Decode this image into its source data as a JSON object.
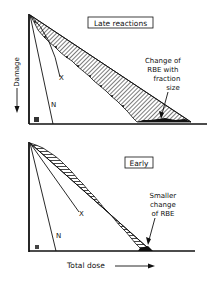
{
  "top_panel": {
    "title": "Late reactions",
    "y_axis_label": "Damage",
    "curve_labels": {
      "x": "X",
      "n": "N"
    },
    "annotation": [
      "Change of",
      "RBE with",
      "fraction",
      "size"
    ]
  },
  "bottom_panel": {
    "title": "Early",
    "curve_labels": {
      "x": "X",
      "n": "N"
    },
    "annotation": [
      "Smaller",
      "change",
      "of RBE"
    ]
  },
  "x_axis_label": "Total dose",
  "colors": {
    "ink": "#111111",
    "background": "#ffffff"
  }
}
